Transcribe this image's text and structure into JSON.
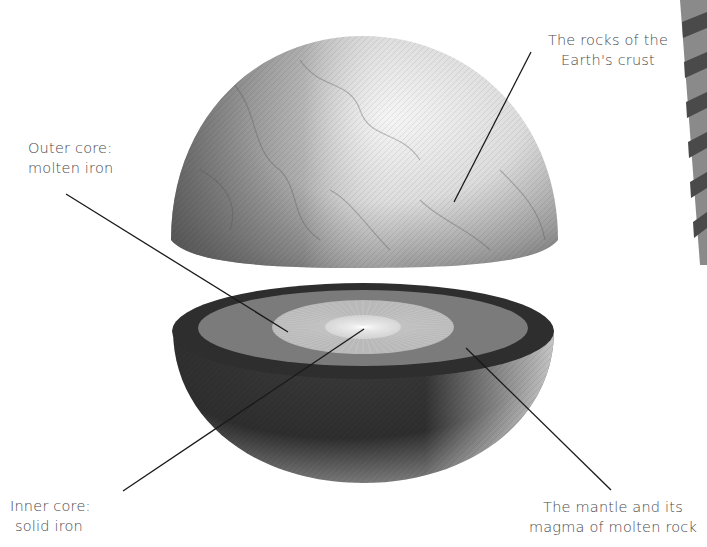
{
  "title": "",
  "labels": {
    "crust": [
      "The rocks of the",
      "Earth's crust"
    ],
    "outer_core": [
      "Outer core:",
      "molten iron"
    ],
    "inner_core": [
      "Inner core:",
      "solid iron"
    ],
    "mantle": [
      "The mantle and its",
      "magma of molten rock"
    ]
  },
  "layers": [
    {
      "name": "crust",
      "color": "#2e2e2e"
    },
    {
      "name": "mantle",
      "color": "#7b7b7b"
    },
    {
      "name": "outer_core",
      "color": "#b9b9b9"
    },
    {
      "name": "inner_core",
      "color": "#d2d2d2"
    }
  ],
  "colors": {
    "leader_line": "#1a1a1a",
    "label_text": "#4a4a4a",
    "edge_strip_light": "#8a8a8a",
    "edge_strip_dark": "#4a4a4a"
  }
}
